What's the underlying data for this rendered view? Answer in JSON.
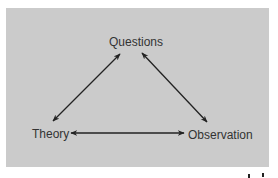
{
  "diagram": {
    "background_color": "#cbcbcb",
    "text_color": "#333333",
    "arrow_color": "#222222",
    "nodes": [
      {
        "id": "questions",
        "label": "Questions"
      },
      {
        "id": "theory",
        "label": "Theory"
      },
      {
        "id": "observation",
        "label": "Observation"
      }
    ],
    "edges": [
      {
        "from": "theory",
        "to": "questions",
        "type": "bidirectional"
      },
      {
        "from": "questions",
        "to": "observation",
        "type": "bidirectional"
      },
      {
        "from": "theory",
        "to": "observation",
        "type": "bidirectional"
      }
    ]
  }
}
